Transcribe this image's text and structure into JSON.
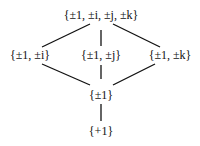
{
  "diagram": {
    "type": "subgroup-lattice",
    "nodes": [
      {
        "id": "Q8",
        "label": "{±1, ±i, ±j, ±k}",
        "x": 101,
        "y": 15
      },
      {
        "id": "Ci",
        "label": "{±1, ±i}",
        "x": 30,
        "y": 55
      },
      {
        "id": "Cj",
        "label": "{±1, ±j}",
        "x": 101,
        "y": 55
      },
      {
        "id": "Ck",
        "label": "{±1, ±k}",
        "x": 170,
        "y": 55
      },
      {
        "id": "C2",
        "label": "{±1}",
        "x": 101,
        "y": 95
      },
      {
        "id": "C1",
        "label": "{+1}",
        "x": 101,
        "y": 131
      }
    ],
    "edges": [
      [
        "Q8",
        "Ci"
      ],
      [
        "Q8",
        "Cj"
      ],
      [
        "Q8",
        "Ck"
      ],
      [
        "Ci",
        "C2"
      ],
      [
        "Cj",
        "C2"
      ],
      [
        "Ck",
        "C2"
      ],
      [
        "C2",
        "C1"
      ]
    ],
    "line_color": "#111111"
  }
}
